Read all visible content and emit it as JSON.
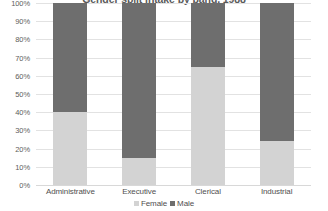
{
  "chart_data": {
    "type": "bar",
    "subtype": "stacked-100-percent",
    "title": "Gender split intake by band, 1988",
    "xlabel": "",
    "ylabel": "",
    "categories": [
      "Administrative",
      "Executive",
      "Clerical",
      "Industrial"
    ],
    "series": [
      {
        "name": "Female",
        "color": "#d3d3d3",
        "values": [
          40,
          15,
          65,
          24
        ]
      },
      {
        "name": "Male",
        "color": "#6e6e6e",
        "values": [
          60,
          85,
          35,
          76
        ]
      }
    ],
    "ylim": [
      0,
      100
    ],
    "y_ticks": [
      0,
      10,
      20,
      30,
      40,
      50,
      60,
      70,
      80,
      90,
      100
    ],
    "y_tick_labels": [
      "0%",
      "10%",
      "20%",
      "30%",
      "40%",
      "50%",
      "60%",
      "70%",
      "80%",
      "90%",
      "100%"
    ],
    "grid": true,
    "grid_axis": "y",
    "legend": [
      "Female",
      "Male"
    ],
    "legend_position": "bottom",
    "units": "percent"
  },
  "colors": {
    "female": "#d3d3d3",
    "male": "#6e6e6e",
    "gridline": "#e2e2e2",
    "axis_text": "#5d5d5d",
    "title_text": "#5a5a5a",
    "background": "#ffffff"
  }
}
